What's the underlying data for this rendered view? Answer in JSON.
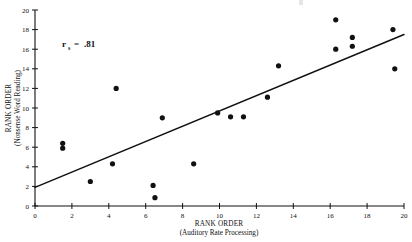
{
  "chart_data": {
    "type": "scatter",
    "title": "",
    "xlabel": "RANK ORDER",
    "xlabel_sub": "(Auditory Rate Processing)",
    "ylabel": "RANK ORDER",
    "ylabel_sub": "(Nonsense Word Reading)",
    "xlim": [
      0,
      20
    ],
    "ylim": [
      0,
      20
    ],
    "xticks": [
      0,
      2,
      4,
      6,
      8,
      10,
      12,
      14,
      16,
      18,
      20
    ],
    "yticks": [
      0,
      2,
      4,
      6,
      8,
      10,
      12,
      14,
      16,
      18,
      20
    ],
    "grid": false,
    "legend": "none",
    "annotation": {
      "symbol": "r",
      "subscript": "s",
      "operator": "=",
      "value": ".81",
      "full_text": "rs = .81"
    },
    "fit_line": {
      "type": "linear-regression",
      "x_start": 0,
      "y_start": 1.9,
      "x_end": 20,
      "y_end": 17.5
    },
    "points": [
      {
        "x": 1.5,
        "y": 6.4
      },
      {
        "x": 1.5,
        "y": 5.9
      },
      {
        "x": 3.0,
        "y": 2.5
      },
      {
        "x": 4.2,
        "y": 4.3
      },
      {
        "x": 4.4,
        "y": 12.0
      },
      {
        "x": 6.4,
        "y": 2.1
      },
      {
        "x": 6.5,
        "y": 0.85
      },
      {
        "x": 6.9,
        "y": 9.0
      },
      {
        "x": 8.6,
        "y": 4.3
      },
      {
        "x": 9.9,
        "y": 9.5
      },
      {
        "x": 10.6,
        "y": 9.1
      },
      {
        "x": 11.3,
        "y": 9.1
      },
      {
        "x": 12.6,
        "y": 11.1
      },
      {
        "x": 13.2,
        "y": 14.3
      },
      {
        "x": 16.3,
        "y": 19.0
      },
      {
        "x": 16.3,
        "y": 16.0
      },
      {
        "x": 17.2,
        "y": 17.2
      },
      {
        "x": 17.2,
        "y": 16.3
      },
      {
        "x": 19.4,
        "y": 18.0
      },
      {
        "x": 19.5,
        "y": 14.0
      }
    ]
  }
}
